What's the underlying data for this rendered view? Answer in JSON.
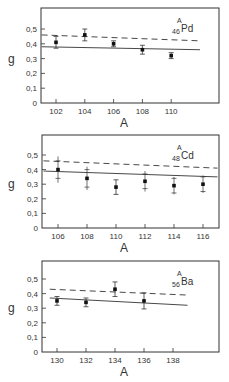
{
  "chart_data": [
    {
      "type": "scatter",
      "title": "46Pd (A)",
      "nucleus": {
        "symbol": "Pd",
        "Z": "46",
        "A": "A"
      },
      "xlabel": "A",
      "ylabel": "g",
      "xticks": [
        102,
        104,
        106,
        108,
        110
      ],
      "yticks": [
        0,
        0.1,
        0.2,
        0.3,
        0.4,
        0.5
      ],
      "ytick_labels": [
        "0",
        "0,1",
        "0,2",
        "0,3",
        "0,4",
        "0,5"
      ],
      "ylim": [
        0,
        0.6
      ],
      "points": [
        {
          "x": 102,
          "y": 0.41,
          "err": 0.04
        },
        {
          "x": 104,
          "y": 0.46,
          "err": 0.04
        },
        {
          "x": 106,
          "y": 0.4,
          "err": 0.02
        },
        {
          "x": 108,
          "y": 0.36,
          "err": 0.03
        },
        {
          "x": 110,
          "y": 0.32,
          "err": 0.02
        }
      ],
      "lines": [
        {
          "style": "dashed",
          "x": [
            101,
            112
          ],
          "y": [
            0.46,
            0.42
          ]
        },
        {
          "style": "solid",
          "x": [
            101,
            112
          ],
          "y": [
            0.38,
            0.36
          ]
        }
      ]
    },
    {
      "type": "scatter",
      "title": "48Cd (A)",
      "nucleus": {
        "symbol": "Cd",
        "Z": "48",
        "A": "A"
      },
      "xlabel": "A",
      "ylabel": "g",
      "xticks": [
        106,
        108,
        110,
        112,
        114,
        116
      ],
      "yticks": [
        0,
        0.1,
        0.2,
        0.3,
        0.4,
        0.5
      ],
      "ytick_labels": [
        "0",
        "0,1",
        "0,2",
        "0,3",
        "0,4",
        "0,5"
      ],
      "ylim": [
        0,
        0.6
      ],
      "points": [
        {
          "x": 106,
          "y": 0.4,
          "err": 0.06,
          "outer_err": 0.09
        },
        {
          "x": 108,
          "y": 0.34,
          "err": 0.06,
          "outer_err": 0.08
        },
        {
          "x": 110,
          "y": 0.28,
          "err": 0.05
        },
        {
          "x": 112,
          "y": 0.32,
          "err": 0.05,
          "outer_err": 0.07
        },
        {
          "x": 114,
          "y": 0.29,
          "err": 0.05,
          "outer_err": 0.06
        },
        {
          "x": 116,
          "y": 0.3,
          "err": 0.05,
          "outer_err": 0.06
        }
      ],
      "lines": [
        {
          "style": "dashed",
          "x": [
            105,
            117
          ],
          "y": [
            0.46,
            0.41
          ]
        },
        {
          "style": "solid",
          "x": [
            105,
            117
          ],
          "y": [
            0.39,
            0.35
          ]
        }
      ]
    },
    {
      "type": "scatter",
      "title": "56Ba (A)",
      "nucleus": {
        "symbol": "Ba",
        "Z": "56",
        "A": "A"
      },
      "xlabel": "A",
      "ylabel": "g",
      "xticks": [
        130,
        132,
        134,
        136,
        138
      ],
      "yticks": [
        0,
        0.1,
        0.2,
        0.3,
        0.4,
        0.5
      ],
      "ytick_labels": [
        "0",
        "0,1",
        "0,2",
        "0,3",
        "0,4",
        "0,5"
      ],
      "ylim": [
        0,
        0.6
      ],
      "points": [
        {
          "x": 130,
          "y": 0.35,
          "err": 0.03
        },
        {
          "x": 132,
          "y": 0.34,
          "err": 0.03
        },
        {
          "x": 134,
          "y": 0.43,
          "err": 0.05
        },
        {
          "x": 136,
          "y": 0.35,
          "err": 0.055
        }
      ],
      "lines": [
        {
          "style": "dashed",
          "x": [
            129.5,
            139
          ],
          "y": [
            0.43,
            0.39
          ]
        },
        {
          "style": "solid",
          "x": [
            129.5,
            139
          ],
          "y": [
            0.37,
            0.32
          ]
        }
      ]
    }
  ],
  "panels": [
    {
      "ylabel": "g",
      "xlabel": "A",
      "sym": "Pd",
      "z": "46",
      "a": "A",
      "xt": [
        "102",
        "104",
        "106",
        "108",
        "110"
      ],
      "yt": [
        "0",
        "0,1",
        "0,2",
        "0,3",
        "0,4",
        "0,5"
      ]
    },
    {
      "ylabel": "g",
      "xlabel": "A",
      "sym": "Cd",
      "z": "48",
      "a": "A",
      "xt": [
        "106",
        "108",
        "110",
        "112",
        "114",
        "116"
      ],
      "yt": [
        "0",
        "0,1",
        "0,2",
        "0,3",
        "0,4",
        "0,5"
      ]
    },
    {
      "ylabel": "g",
      "xlabel": "A",
      "sym": "Ba",
      "z": "56",
      "a": "A",
      "xt": [
        "130",
        "132",
        "134",
        "136",
        "138"
      ],
      "yt": [
        "0",
        "0,1",
        "0,2",
        "0,3",
        "0,4",
        "0,5"
      ]
    }
  ]
}
